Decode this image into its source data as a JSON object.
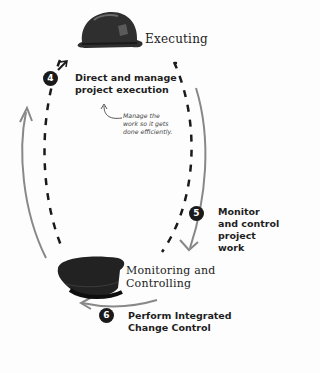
{
  "phases": {
    "executing": {
      "label": "Executing",
      "icon": "hard-hat-icon"
    },
    "monitoring": {
      "label_line1": "Monitoring and",
      "label_line2": "Controlling",
      "icon": "police-cap-icon"
    }
  },
  "steps": [
    {
      "number": "4",
      "line1": "Direct and manage",
      "line2": "project execution"
    },
    {
      "number": "5",
      "line1": "Monitor",
      "line2": "and control",
      "line3": "project",
      "line4": "work"
    },
    {
      "number": "6",
      "line1": "Perform Integrated",
      "line2": "Change Control"
    }
  ],
  "note": {
    "line1": "Manage the",
    "line2": "work so it gets",
    "line3": "done efficiently."
  },
  "colors": {
    "dashes": "#1a1a1a",
    "arrows": "#808080",
    "badge": "#1a1a1a",
    "text": "#1e1e1e"
  }
}
